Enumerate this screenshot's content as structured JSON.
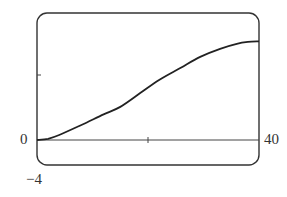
{
  "chart_data": {
    "type": "line",
    "title": "",
    "xlabel": "",
    "ylabel": "",
    "xlim": [
      0,
      40
    ],
    "ylim": [
      -4,
      20
    ],
    "grid": false,
    "legend": null,
    "x_ticks": [
      20
    ],
    "y_ticks": [
      10
    ],
    "tick_labels": {
      "x_min": "0",
      "x_max": "40",
      "y_min": "−4"
    },
    "series": [
      {
        "name": "curve",
        "x": [
          0,
          2,
          4,
          8,
          12,
          15,
          18.6,
          22,
          26,
          29.4,
          33,
          36,
          38,
          40
        ],
        "y": [
          0,
          0.2,
          0.8,
          2.4,
          4.1,
          5.3,
          7.5,
          9.6,
          11.6,
          13.3,
          14.6,
          15.4,
          15.7,
          15.8
        ]
      }
    ]
  },
  "labels": {
    "x_min": "0",
    "x_max": "40",
    "y_min": "−4"
  },
  "colors": {
    "frame": "#333333",
    "curve": "#222222",
    "axis": "#444444"
  }
}
